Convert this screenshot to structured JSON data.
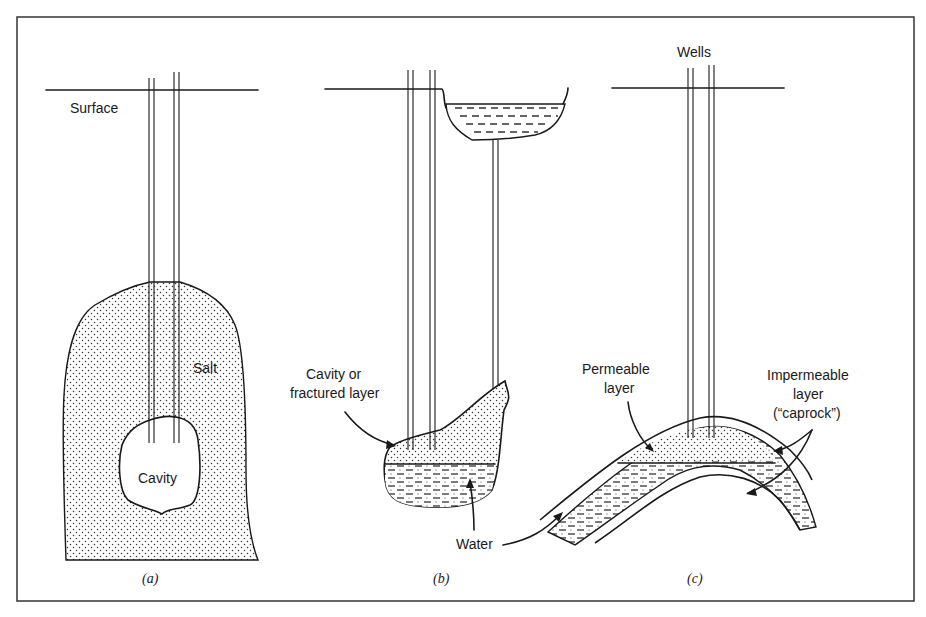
{
  "figure": {
    "panels": [
      {
        "id": "a",
        "caption": "(a)",
        "labels": {
          "surface": "Surface",
          "salt": "Salt",
          "cavity": "Cavity"
        }
      },
      {
        "id": "b",
        "caption": "(b)",
        "labels": {
          "cavity_line1": "Cavity or",
          "cavity_line2": "fractured layer",
          "water": "Water"
        }
      },
      {
        "id": "c",
        "caption": "(c)",
        "labels": {
          "wells": "Wells",
          "permeable_line1": "Permeable",
          "permeable_line2": "layer",
          "impermeable_line1": "Impermeable",
          "impermeable_line2": "layer",
          "impermeable_line3": "(“caprock”)"
        }
      }
    ],
    "colors": {
      "ink": "#1a1a1a",
      "background": "#ffffff",
      "frame": "#333333"
    }
  }
}
